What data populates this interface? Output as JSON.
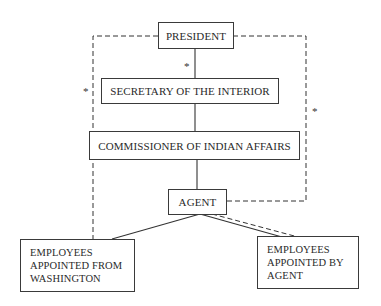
{
  "diagram": {
    "type": "organizational-chart",
    "nodes": [
      {
        "id": "president",
        "label": "PRESIDENT"
      },
      {
        "id": "secretary",
        "label": "SECRETARY OF THE INTERIOR"
      },
      {
        "id": "commissioner",
        "label": "COMMISSIONER OF INDIAN AFFAIRS"
      },
      {
        "id": "agent",
        "label": "AGENT"
      },
      {
        "id": "employees_washington",
        "lines": [
          "EMPLOYEES",
          "APPOINTED FROM",
          "WASHINGTON"
        ]
      },
      {
        "id": "employees_agent",
        "lines": [
          "EMPLOYEES",
          "APPOINTED BY",
          "AGENT"
        ]
      }
    ],
    "edges": [
      {
        "from": "president",
        "to": "secretary",
        "style": "solid",
        "marker": "*"
      },
      {
        "from": "secretary",
        "to": "commissioner",
        "style": "solid"
      },
      {
        "from": "commissioner",
        "to": "agent",
        "style": "solid"
      },
      {
        "from": "agent",
        "to": "employees_washington",
        "style": "solid"
      },
      {
        "from": "agent",
        "to": "employees_agent",
        "style": "solid"
      },
      {
        "from": "agent",
        "to": "employees_agent",
        "style": "dashed"
      },
      {
        "from": "president",
        "to": "employees_washington",
        "style": "dashed",
        "marker": "*"
      },
      {
        "from": "president",
        "to": "agent",
        "style": "dashed",
        "marker": "*"
      }
    ],
    "markers": {
      "asterisk": "*"
    }
  }
}
